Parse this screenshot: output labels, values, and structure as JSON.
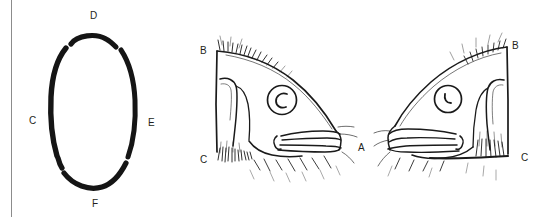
{
  "figure": {
    "width": 547,
    "height": 217,
    "background": "#ffffff",
    "ink_color": "#231f20",
    "rule_color": "#8c8c8c"
  },
  "panels": [
    {
      "id": "oval-diagram",
      "name": "egg-outline-diagram",
      "labels": [
        {
          "text": "D",
          "x": 90,
          "y": 11
        },
        {
          "text": "C",
          "x": 29,
          "y": 116
        },
        {
          "text": "E",
          "x": 148,
          "y": 118
        },
        {
          "text": "F",
          "x": 92,
          "y": 199
        }
      ]
    },
    {
      "id": "fish-head-left",
      "name": "fish-head-left-view",
      "labels": [
        {
          "text": "B",
          "x": 200,
          "y": 46
        },
        {
          "text": "C",
          "x": 200,
          "y": 155
        },
        {
          "text": "A",
          "x": 358,
          "y": 143
        }
      ],
      "eye": {
        "pupil_shape": "c-shaped"
      }
    },
    {
      "id": "fish-head-right",
      "name": "fish-head-right-view",
      "labels": [
        {
          "text": "B",
          "x": 512,
          "y": 41
        },
        {
          "text": "C",
          "x": 521,
          "y": 153
        }
      ],
      "eye": {
        "pupil_shape": "crescent"
      }
    }
  ]
}
